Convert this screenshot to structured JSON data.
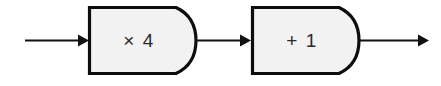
{
  "diagram": {
    "type": "function-machine-flowchart",
    "background_color": "#ffffff",
    "title": "",
    "machines": [
      {
        "id": "multiply-by-four",
        "label": "× 4",
        "operation": "multiply",
        "operand": "4",
        "fill_color": "#f2f2f2",
        "stroke_color": "#0d0d0d"
      },
      {
        "id": "add-one",
        "label": "+ 1",
        "operation": "add",
        "operand": "1",
        "fill_color": "#f2f2f2",
        "stroke_color": "#0d0d0d"
      }
    ],
    "arrows": [
      {
        "id": "input-arrow",
        "label": ""
      },
      {
        "id": "middle-arrow",
        "label": ""
      },
      {
        "id": "output-arrow",
        "label": ""
      }
    ]
  }
}
